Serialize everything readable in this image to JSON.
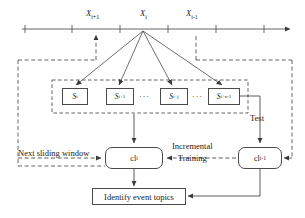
{
  "diagram": {
    "colors": {
      "stroke": "#4a4a4a",
      "text": "#1a1a1a",
      "background": "#ffffff",
      "dashed": "#555555"
    },
    "timeline": {
      "name": "time-axis",
      "ticks": [
        25,
        72,
        120,
        168,
        216,
        264
      ],
      "arrow_end": 289,
      "labels": [
        {
          "id": "x-next",
          "base": "X",
          "sub": "i+1",
          "x": 86,
          "y": 10
        },
        {
          "id": "x-current",
          "base": "X",
          "sub": "i",
          "x": 140,
          "y": 10
        },
        {
          "id": "x-prev",
          "base": "X",
          "sub": "i-1",
          "x": 186,
          "y": 10
        }
      ]
    },
    "segments": {
      "name": "sentence-boxes",
      "items": [
        {
          "base": "S",
          "sub": "i",
          "x": 62,
          "y": 88,
          "w": 26,
          "h": 17
        },
        {
          "base": "S",
          "sub": "i+1",
          "x": 106,
          "y": 88,
          "w": 28,
          "h": 17
        },
        {
          "base": "S",
          "sub": "i+j",
          "x": 160,
          "y": 88,
          "w": 28,
          "h": 17
        },
        {
          "base": "S",
          "sub": "i+n-1",
          "x": 208,
          "y": 88,
          "w": 32,
          "h": 17
        }
      ],
      "ellipses": [
        {
          "text": "···",
          "x": 139,
          "y": 93
        },
        {
          "text": "···",
          "x": 192,
          "y": 93
        }
      ]
    },
    "classifiers": [
      {
        "id": "cl-current",
        "base": "cl",
        "sub": "i",
        "x": 105,
        "y": 147,
        "w": 58,
        "h": 22
      },
      {
        "id": "cl-previous",
        "base": "cl",
        "sub": "i-1",
        "x": 238,
        "y": 147,
        "w": 44,
        "h": 22
      }
    ],
    "output_box": {
      "id": "identify-event-topics",
      "label": "Identify event topics",
      "x": 92,
      "y": 188,
      "w": 94,
      "h": 17
    },
    "edge_labels": [
      {
        "id": "next-sliding-window-label",
        "text": "Next sliding window",
        "x": 18,
        "y": 149
      },
      {
        "id": "incremental-training-label",
        "line1": "Incremental",
        "line2": "Training",
        "x": 176,
        "y": 143
      },
      {
        "id": "test-label",
        "text": "Test",
        "x": 250,
        "y": 114
      }
    ]
  }
}
